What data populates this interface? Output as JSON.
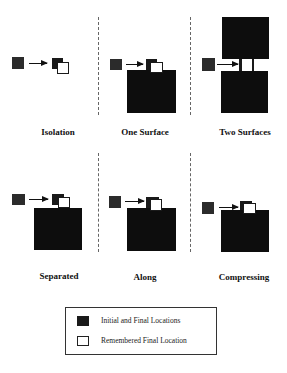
{
  "panels": [
    {
      "id": "isolation",
      "label": "Isolation"
    },
    {
      "id": "one-surface",
      "label": "One Surface"
    },
    {
      "id": "two-surfaces",
      "label": "Two Surfaces"
    },
    {
      "id": "separated",
      "label": "Separated"
    },
    {
      "id": "along",
      "label": "Along"
    },
    {
      "id": "compressing",
      "label": "Compressing"
    }
  ],
  "legend": {
    "items": [
      {
        "swatch": "filled-black",
        "label": "Initial and Final Locations"
      },
      {
        "swatch": "outlined-white",
        "label": "Remembered Final Location"
      }
    ]
  },
  "colors": {
    "filled": "#1a1a1a",
    "background": "#ffffff"
  }
}
